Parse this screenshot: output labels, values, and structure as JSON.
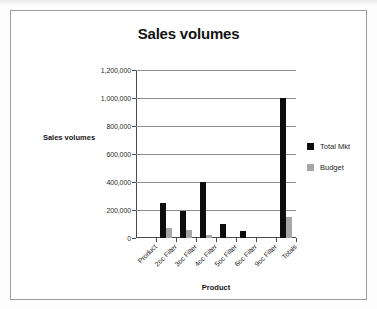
{
  "chart_data": {
    "type": "bar",
    "title": "Sales volumes",
    "xlabel": "Product",
    "ylabel": "Sales volumes",
    "categories": [
      "Product",
      "2oc Filter",
      "3oc Filter",
      "4oc Filter",
      "5oc Filter",
      "6oc Filter",
      "9oc Filter",
      "Totals"
    ],
    "series": [
      {
        "name": "Total Mkt",
        "color": "#0d0d0d",
        "values": [
          0,
          250000,
          195000,
          400000,
          100000,
          50000,
          0,
          1000000
        ]
      },
      {
        "name": "Budget",
        "color": "#a6a6a6",
        "values": [
          0,
          70000,
          60000,
          20000,
          0,
          0,
          0,
          150000
        ]
      }
    ],
    "ylim": [
      0,
      1200000
    ],
    "ytick_values": [
      0,
      200000,
      400000,
      600000,
      800000,
      1000000,
      1200000
    ],
    "ytick_labels": [
      "0",
      "200,000",
      "400,000",
      "600,000",
      "800,000",
      "1,000,000",
      "1,200,000"
    ],
    "grid": true,
    "legend_position": "right"
  },
  "legend": {
    "entries": [
      {
        "label": "Total Mkt",
        "color": "#0d0d0d"
      },
      {
        "label": "Budget",
        "color": "#a6a6a6"
      }
    ]
  }
}
